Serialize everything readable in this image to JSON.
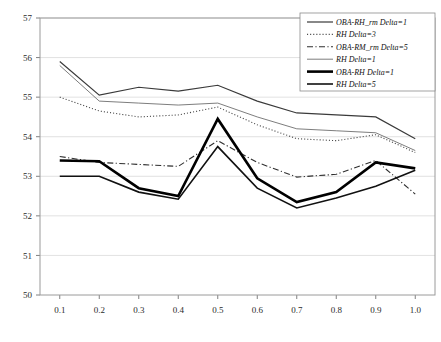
{
  "chart_data": {
    "type": "line",
    "title": "",
    "xlabel": "",
    "ylabel": "",
    "xlim": [
      0.05,
      1.05
    ],
    "ylim": [
      50,
      57
    ],
    "grid": true,
    "legend_position": "top-right",
    "x": [
      0.1,
      0.2,
      0.3,
      0.4,
      0.5,
      0.6,
      0.7,
      0.8,
      0.9,
      1.0
    ],
    "xtick_labels": [
      "0.1",
      "0.2",
      "0.3",
      "0.4",
      "0.5",
      "0.6",
      "0.7",
      "0.8",
      "0.9",
      "1.0"
    ],
    "ytick_labels": [
      "50",
      "51",
      "52",
      "53",
      "54",
      "55",
      "56",
      "57"
    ],
    "ytick_values": [
      50,
      51,
      52,
      53,
      54,
      55,
      56,
      57
    ],
    "series": [
      {
        "name": "OBA-RH_rm Delta=1",
        "style": "solid",
        "width": 1.2,
        "color": "#3a3a3a",
        "values": [
          55.9,
          55.05,
          55.25,
          55.15,
          55.3,
          54.9,
          54.6,
          54.55,
          54.5,
          53.95
        ]
      },
      {
        "name": "RH Delta=3",
        "style": "dotted",
        "width": 1.1,
        "color": "#4a4a4a",
        "values": [
          55.0,
          54.65,
          54.5,
          54.55,
          54.75,
          54.3,
          53.95,
          53.9,
          54.05,
          53.6
        ]
      },
      {
        "name": "OBA-RM_rm Delta=5",
        "style": "dashdot",
        "width": 1.1,
        "color": "#2f2f2f",
        "values": [
          53.5,
          53.35,
          53.3,
          53.25,
          53.9,
          53.35,
          52.98,
          53.05,
          53.4,
          52.55
        ]
      },
      {
        "name": "RH Delta=1",
        "style": "solid",
        "width": 0.9,
        "color": "#6e6e6e",
        "values": [
          55.8,
          54.9,
          54.85,
          54.8,
          54.85,
          54.5,
          54.2,
          54.15,
          54.1,
          53.65
        ]
      },
      {
        "name": "OBA-RH Delta=1",
        "style": "solid",
        "width": 2.6,
        "color": "#000000",
        "values": [
          53.4,
          53.38,
          52.7,
          52.5,
          54.45,
          52.95,
          52.35,
          52.6,
          53.35,
          53.2
        ]
      },
      {
        "name": "RH Delta=5",
        "style": "solid",
        "width": 1.6,
        "color": "#111111",
        "values": [
          53.0,
          53.0,
          52.6,
          52.42,
          53.75,
          52.7,
          52.2,
          52.45,
          52.75,
          53.15
        ]
      }
    ]
  },
  "legend": {
    "entries": [
      {
        "label": "OBA-RH_rm Delta=1"
      },
      {
        "label": "RH Delta=3"
      },
      {
        "label": "OBA-RM_rm Delta=5"
      },
      {
        "label": "RH Delta=1"
      },
      {
        "label": "OBA-RH Delta=1"
      },
      {
        "label": "RH Delta=5"
      }
    ]
  }
}
